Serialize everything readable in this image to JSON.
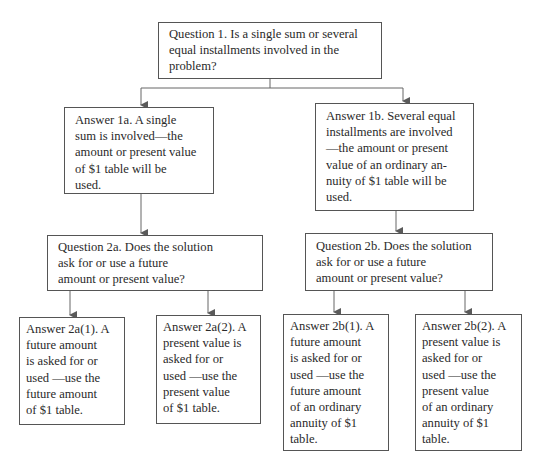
{
  "diagram": {
    "type": "decision-flowchart",
    "nodes": {
      "q1": {
        "lines": [
          "Question 1. Is a single sum or several",
          "equal installments involved in the",
          "problem?"
        ]
      },
      "a1a": {
        "lines": [
          "Answer 1a. A single",
          "sum is involved—the",
          "amount or present value",
          "of $1 table will be",
          "used."
        ]
      },
      "a1b": {
        "lines": [
          "Answer 1b. Several equal",
          "installments are involved",
          "—the amount or present",
          "value of an ordinary an-",
          "nuity of $1 table will be",
          "used."
        ]
      },
      "q2a": {
        "lines": [
          "Question 2a. Does the solution",
          "ask for or use a future",
          "amount or present value?"
        ]
      },
      "q2b": {
        "lines": [
          "Question 2b. Does the solution",
          "ask for or use a future",
          "amount or present value?"
        ]
      },
      "a2a1": {
        "lines": [
          "Answer 2a(1). A",
          "future amount",
          "is asked for or",
          "used —use the",
          "future amount",
          "of $1 table."
        ]
      },
      "a2a2": {
        "lines": [
          "Answer 2a(2). A",
          "present value is",
          "asked for or",
          "used —use the",
          "present value",
          "of $1 table."
        ]
      },
      "a2b1": {
        "lines": [
          "Answer 2b(1). A",
          "future amount",
          "is asked for or",
          "used —use the",
          "future amount",
          "of an ordinary",
          "annuity of $1",
          "table."
        ]
      },
      "a2b2": {
        "lines": [
          "Answer 2b(2). A",
          "present value is",
          "asked for or",
          "used —use the",
          "present value",
          "of an ordinary",
          "annuity of $1",
          "table."
        ]
      }
    },
    "edges": [
      [
        "q1",
        "a1a"
      ],
      [
        "q1",
        "a1b"
      ],
      [
        "a1a",
        "q2a"
      ],
      [
        "a1b",
        "q2b"
      ],
      [
        "q2a",
        "a2a1"
      ],
      [
        "q2a",
        "a2a2"
      ],
      [
        "q2b",
        "a2b1"
      ],
      [
        "q2b",
        "a2b2"
      ]
    ],
    "colors": {
      "line": "#555555",
      "arrow": "#5a5a5a",
      "text": "#2a2a2a",
      "background": "#ffffff"
    }
  }
}
